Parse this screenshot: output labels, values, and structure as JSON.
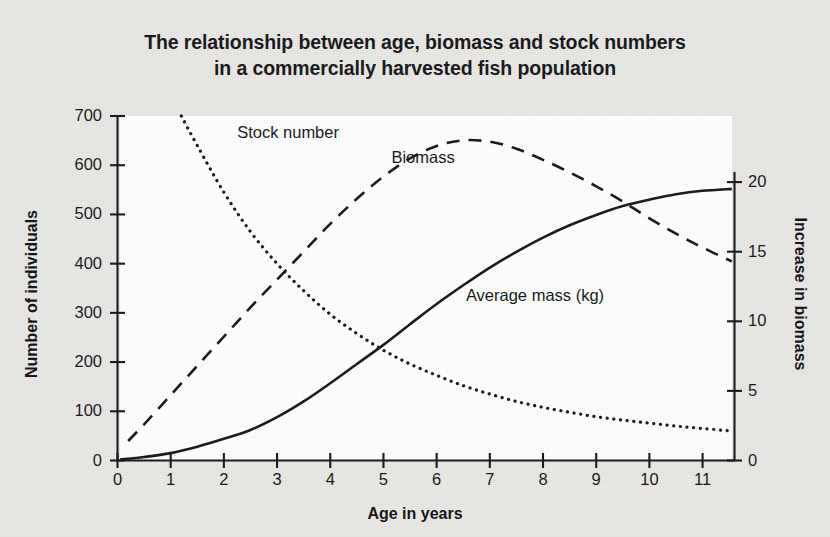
{
  "title": {
    "line1": "The relationship between age, biomass and stock numbers",
    "line2": "in a commercially harvested fish population"
  },
  "axes": {
    "x_title": "Age in years",
    "y_left_title": "Number of individuals",
    "y_right_title": "Increase in biomass"
  },
  "chart_data": {
    "type": "line",
    "title": "The relationship between age, biomass and stock numbers in a commercially harvested fish population",
    "xlabel": "Age in years",
    "ylabel": "Number of individuals",
    "y2label": "Increase in biomass",
    "xlim": [
      0,
      11.6
    ],
    "ylim": [
      0,
      700
    ],
    "y2lim": [
      0,
      23.5
    ],
    "xticks": [
      0,
      1,
      2,
      3,
      4,
      5,
      6,
      7,
      8,
      9,
      10,
      11
    ],
    "xticklabels": [
      "0",
      "1",
      "2",
      "3",
      "4",
      "5",
      "6",
      "7",
      "8",
      "9",
      "10",
      "11"
    ],
    "yticks": [
      0,
      100,
      200,
      300,
      400,
      500,
      600,
      700
    ],
    "yticklabels": [
      "0",
      "100",
      "200",
      "300",
      "400",
      "500",
      "600",
      "700"
    ],
    "y2ticks": [
      0,
      5,
      10,
      15,
      20
    ],
    "y2ticklabels": [
      "0",
      "5",
      "10",
      "15",
      "20"
    ],
    "grid": false,
    "legend": "inline-annotations",
    "series": [
      {
        "name": "Stock number",
        "label": "Stock number",
        "axis": "left",
        "style": "dotted",
        "color": "#17171b",
        "x": [
          1.2,
          1.5,
          2.0,
          2.5,
          3.0,
          3.5,
          4.0,
          4.5,
          5.0,
          5.5,
          6.0,
          6.5,
          7.0,
          7.5,
          8.0,
          8.5,
          9.0,
          9.5,
          10.0,
          10.5,
          11.0,
          11.55
        ],
        "y": [
          700,
          640,
          545,
          465,
          400,
          345,
          297,
          258,
          224,
          196,
          173,
          152,
          135,
          120,
          108,
          98,
          89,
          82,
          76,
          70,
          65,
          60
        ]
      },
      {
        "name": "Biomass",
        "label": "Biomass",
        "axis": "right",
        "style": "dashed",
        "color": "#17171b",
        "x": [
          0.2,
          0.5,
          1.0,
          1.5,
          2.0,
          2.5,
          3.0,
          3.5,
          4.0,
          4.5,
          5.0,
          5.5,
          6.0,
          6.5,
          7.0,
          7.5,
          8.0,
          8.5,
          9.0,
          9.5,
          10.0,
          10.5,
          11.0,
          11.55
        ],
        "y": [
          1.4,
          2.6,
          4.7,
          6.8,
          8.9,
          11.0,
          13.0,
          15.0,
          17.0,
          18.8,
          20.4,
          21.7,
          22.6,
          23.0,
          22.9,
          22.4,
          21.6,
          20.7,
          19.7,
          18.6,
          17.4,
          16.3,
          15.3,
          14.3
        ]
      },
      {
        "name": "Average mass (kg)",
        "label": "Average mass (kg)",
        "axis": "left",
        "style": "solid",
        "color": "#17171b",
        "x": [
          0.05,
          0.5,
          1.0,
          1.5,
          2.0,
          2.5,
          3.0,
          3.5,
          4.0,
          4.5,
          5.0,
          5.5,
          6.0,
          6.5,
          7.0,
          7.5,
          8.0,
          8.5,
          9.0,
          9.5,
          10.0,
          10.5,
          11.0,
          11.55
        ],
        "y": [
          2,
          7,
          15,
          28,
          44,
          62,
          88,
          120,
          157,
          196,
          235,
          277,
          318,
          356,
          392,
          424,
          453,
          478,
          499,
          517,
          530,
          541,
          548,
          552
        ]
      }
    ],
    "annotations": [
      {
        "text": "Stock number",
        "x": 2.25,
        "y_px": 133
      },
      {
        "text": "Biomass",
        "x": 5.15,
        "y_px": 158
      },
      {
        "text": "Average mass (kg)",
        "x": 6.55,
        "y_px": 296
      }
    ]
  }
}
